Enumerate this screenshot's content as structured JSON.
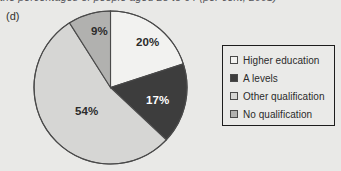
{
  "figure": {
    "part_label": "(d)",
    "clipped_caption": "the percentages of people aged 25 to 64 (per cent, 2001)"
  },
  "legend": {
    "items": [
      {
        "label": "Higher education",
        "color": "#f2f2f0",
        "swatch_name": "legend-swatch-higher-education"
      },
      {
        "label": "A levels",
        "color": "#3d3d3d",
        "swatch_name": "legend-swatch-a-levels"
      },
      {
        "label": "Other qualification",
        "color": "#d6d6d4",
        "swatch_name": "legend-swatch-other-qualification"
      },
      {
        "label": "No qualification",
        "color": "#b1b1af",
        "swatch_name": "legend-swatch-no-qualification"
      }
    ]
  },
  "chart_data": {
    "type": "pie",
    "title": "",
    "categories": [
      "Higher education",
      "A levels",
      "Other qualification",
      "No qualification"
    ],
    "values": [
      20,
      17,
      54,
      9
    ],
    "unit": "%",
    "labels": [
      "20%",
      "17%",
      "54%",
      "9%"
    ],
    "colors": [
      "#f2f2f0",
      "#3d3d3d",
      "#d6d6d4",
      "#b1b1af"
    ],
    "label_colors": [
      "#2b2b2b",
      "#ffffff",
      "#2b2b2b",
      "#2b2b2b"
    ],
    "start_angle_deg": 0,
    "direction": "clockwise",
    "legend_position": "right",
    "grid": false
  },
  "geometry": {
    "cx": 77.5,
    "cy": 77.5,
    "r": 76.5,
    "label_positions": [
      {
        "x": 103,
        "y": 36
      },
      {
        "x": 113,
        "y": 94
      },
      {
        "x": 42,
        "y": 105
      },
      {
        "x": 58,
        "y": 25
      }
    ]
  }
}
